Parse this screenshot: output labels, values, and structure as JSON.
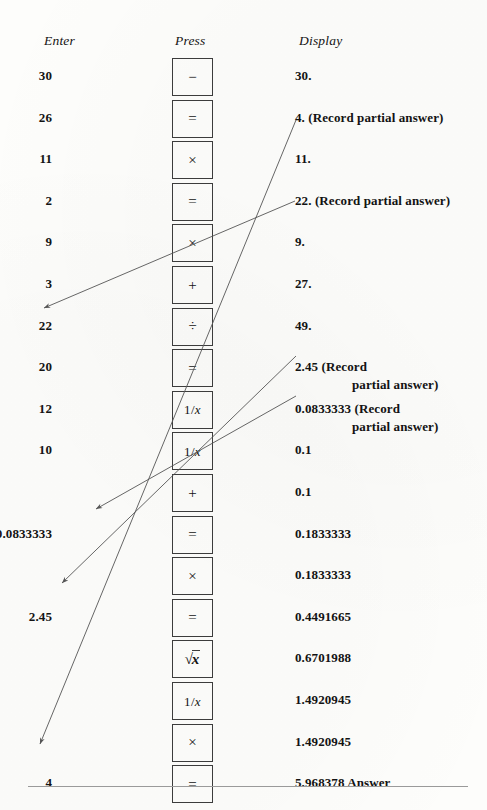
{
  "figure": {
    "kind": "calculator-keystroke-table",
    "headers": {
      "enter": "Enter",
      "press": "Press",
      "display": "Display"
    }
  },
  "rows": [
    {
      "enter": "30",
      "key": "−",
      "key_name": "minus-key",
      "display": "30.",
      "display_cont": ""
    },
    {
      "enter": "26",
      "key": "=",
      "key_name": "equals-key",
      "display": "4. (Record partial answer)",
      "display_cont": ""
    },
    {
      "enter": "11",
      "key": "×",
      "key_name": "multiply-key",
      "display": "11.",
      "display_cont": ""
    },
    {
      "enter": "2",
      "key": "=",
      "key_name": "equals-key",
      "display": "22. (Record partial answer)",
      "display_cont": ""
    },
    {
      "enter": "9",
      "key": "×",
      "key_name": "multiply-key",
      "display": "9.",
      "display_cont": ""
    },
    {
      "enter": "3",
      "key": "+",
      "key_name": "plus-key",
      "display": "27.",
      "display_cont": ""
    },
    {
      "enter": "22",
      "key": "÷",
      "key_name": "divide-key",
      "display": "49.",
      "display_cont": ""
    },
    {
      "enter": "20",
      "key": "=",
      "key_name": "equals-key",
      "display": "2.45 (Record",
      "display_cont": "partial answer)"
    },
    {
      "enter": "12",
      "key": "1/x",
      "key_name": "reciprocal-key",
      "display": "0.0833333 (Record",
      "display_cont": "partial answer)"
    },
    {
      "enter": "10",
      "key": "1/x",
      "key_name": "reciprocal-key",
      "display": "0.1",
      "display_cont": ""
    },
    {
      "enter": "",
      "key": "+",
      "key_name": "plus-key",
      "display": "0.1",
      "display_cont": ""
    },
    {
      "enter": "0.0833333",
      "key": "=",
      "key_name": "equals-key",
      "display": "0.1833333",
      "display_cont": ""
    },
    {
      "enter": "",
      "key": "×",
      "key_name": "multiply-key",
      "display": "0.1833333",
      "display_cont": ""
    },
    {
      "enter": "2.45",
      "key": "=",
      "key_name": "equals-key",
      "display": "0.4491665",
      "display_cont": ""
    },
    {
      "enter": "",
      "key": "√x",
      "key_name": "square-root-key",
      "display": "0.6701988",
      "display_cont": ""
    },
    {
      "enter": "",
      "key": "1/x",
      "key_name": "reciprocal-key",
      "display": "1.4920945",
      "display_cont": ""
    },
    {
      "enter": "",
      "key": "×",
      "key_name": "multiply-key",
      "display": "1.4920945",
      "display_cont": ""
    },
    {
      "enter": "4",
      "key": "=",
      "key_name": "equals-key",
      "display": "5.968378  Answer",
      "display_cont": ""
    }
  ],
  "arrows": [
    {
      "name": "arrow-4-to-entry",
      "from_label": "4. (Record partial answer)",
      "to_label": "4",
      "x1": 296,
      "y1": 120,
      "x2": 40,
      "y2": 744
    },
    {
      "name": "arrow-22-to-entry",
      "from_label": "22. (Record partial answer)",
      "to_label": "22",
      "x1": 295,
      "y1": 201,
      "x2": 44,
      "y2": 308
    },
    {
      "name": "arrow-245-to-entry",
      "from_label": "2.45 (Record partial answer)",
      "to_label": "2.45",
      "x1": 296,
      "y1": 356,
      "x2": 62,
      "y2": 583
    },
    {
      "name": "arrow-00833333-to-entry",
      "from_label": "0.0833333 (Record partial answer)",
      "to_label": "0.0833333",
      "x1": 296,
      "y1": 396,
      "x2": 96,
      "y2": 509
    }
  ],
  "colors": {
    "ink": "#131313",
    "key_border": "#3c3c3c",
    "arrow": "#555555",
    "rule": "#9a9a9a",
    "paper": "#fdfdfb"
  }
}
